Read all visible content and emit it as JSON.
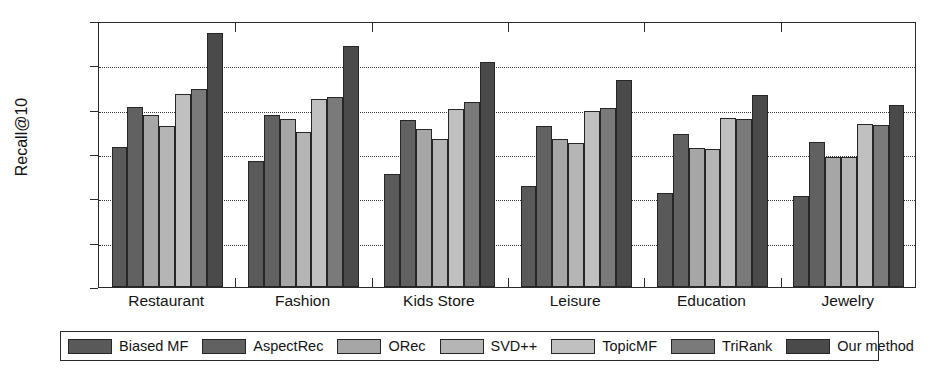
{
  "chart_data": {
    "type": "bar",
    "title": "",
    "subtitle": "",
    "xlabel": "",
    "ylabel": "Recall@10",
    "ylim": [
      0,
      0.12
    ],
    "ytick_labels": [
      "0",
      "0.02",
      "0.04",
      "0.06",
      "0.08",
      "0.1",
      "0.12"
    ],
    "ytick_values": [
      0,
      0.02,
      0.04,
      0.06,
      0.08,
      0.1,
      0.12
    ],
    "grid": true,
    "grid_axis": "y",
    "legend_position": "bottom",
    "categories": [
      "Restaurant",
      "Fashion",
      "Kids Store",
      "Leisure",
      "Education",
      "Jewelry"
    ],
    "series": [
      {
        "name": "Biased MF",
        "color": "#595959",
        "values": [
          0.063,
          0.057,
          0.051,
          0.0455,
          0.0425,
          0.041
        ]
      },
      {
        "name": "AspectRec",
        "color": "#616161",
        "values": [
          0.081,
          0.0775,
          0.0755,
          0.0725,
          0.069,
          0.0655
        ]
      },
      {
        "name": "ORec",
        "color": "#a6a6a6",
        "values": [
          0.0775,
          0.0757,
          0.0712,
          0.0668,
          0.0625,
          0.0585
        ]
      },
      {
        "name": "SVD++",
        "color": "#b5b5b5",
        "values": [
          0.0727,
          0.0698,
          0.0668,
          0.0648,
          0.0622,
          0.0585
        ]
      },
      {
        "name": "TopicMF",
        "color": "#c0c0c0",
        "values": [
          0.0872,
          0.0849,
          0.0805,
          0.0795,
          0.0762,
          0.0737
        ]
      },
      {
        "name": "TriRank",
        "color": "#7a7a7a",
        "values": [
          0.0892,
          0.0858,
          0.0833,
          0.0808,
          0.0757,
          0.0732
        ]
      },
      {
        "name": "Our method",
        "color": "#4a4a4a",
        "values": [
          0.1145,
          0.1088,
          0.1015,
          0.0932,
          0.0865,
          0.0822
        ]
      }
    ]
  },
  "axis": {
    "y_label": "Recall@10"
  }
}
